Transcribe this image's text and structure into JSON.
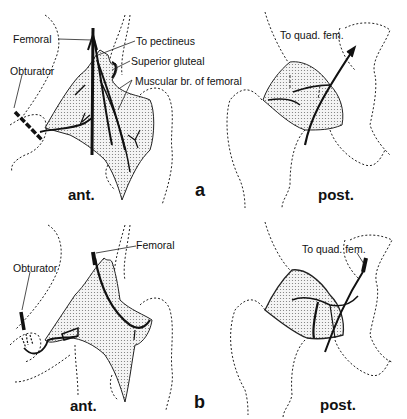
{
  "figure": {
    "panels": [
      {
        "letter": "a",
        "anterior": {
          "view_label": "ant.",
          "labels": {
            "femoral": "Femoral",
            "obturator": "Obturator",
            "to_pectineus": "To pectineus",
            "superior_gluteal": "Superior gluteal",
            "muscular_br": "Muscular br. of femoral"
          }
        },
        "posterior": {
          "view_label": "post.",
          "labels": {
            "to_quad_fem": "To quad. fem."
          }
        }
      },
      {
        "letter": "b",
        "anterior": {
          "view_label": "ant.",
          "labels": {
            "femoral": "Femoral",
            "obturator": "Obturator"
          }
        },
        "posterior": {
          "view_label": "post.",
          "labels": {
            "to_quad_fem": "To quad. fem."
          }
        }
      }
    ],
    "colors": {
      "ink": "#111111",
      "stipple": "#cfcfcf",
      "background": "#ffffff"
    }
  }
}
